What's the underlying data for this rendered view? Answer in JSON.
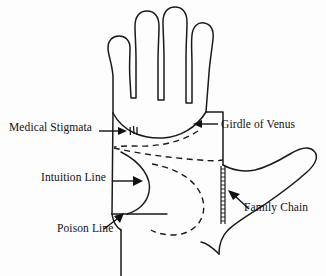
{
  "figure": {
    "background_color": "#fdfdfd",
    "ink_color": "#1a1a1a",
    "width": 326,
    "height": 276
  },
  "labels": {
    "medical_stigmata": "Medical Stigmata",
    "girdle_of_venus": "Girdle of Venus",
    "intuition_line": "Intuition Line",
    "poison_line": "Poison Line",
    "family_chain": "Family Chain"
  },
  "annotations": [
    {
      "name": "medical-stigmata",
      "label": "Medical Stigmata",
      "label_side": "left",
      "arrow_direction": "right",
      "marker": "three-vertical-ticks",
      "marker_count": 3,
      "line_style": "solid"
    },
    {
      "name": "girdle-of-venus",
      "label": "Girdle of Venus",
      "label_side": "right",
      "arrow_direction": "left",
      "marker": "dashed-arc",
      "line_style": "dashed"
    },
    {
      "name": "intuition-line",
      "label": "Intuition Line",
      "label_side": "left",
      "arrow_direction": "right",
      "marker": "bow-curve",
      "line_style": "solid"
    },
    {
      "name": "poison-line",
      "label": "Poison Line",
      "label_side": "left",
      "arrow_direction": "up-right",
      "marker": "horizontal-line",
      "line_style": "solid"
    },
    {
      "name": "family-chain",
      "label": "Family Chain",
      "label_side": "right",
      "arrow_direction": "up-left",
      "marker": "ladder-chain",
      "line_style": "chained"
    }
  ]
}
